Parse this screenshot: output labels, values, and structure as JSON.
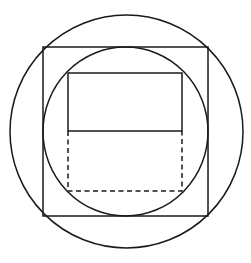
{
  "canvas": {
    "width": 251,
    "height": 263,
    "background": "#ffffff"
  },
  "stroke": {
    "color": "#1a1a1a",
    "width": 1.5,
    "dash": "5 3.5"
  },
  "figure": {
    "outer_circle": {
      "cx": 126.5,
      "cy": 131.5,
      "r": 116.5
    },
    "square": {
      "x": 43,
      "y": 47,
      "width": 165,
      "height": 169
    },
    "inner_circle": {
      "cx": 125.5,
      "cy": 131.5,
      "rx": 82.5,
      "ry": 84.5
    },
    "inner_rect_solid": {
      "x": 68,
      "y": 73,
      "width": 114,
      "height": 58
    },
    "inner_rect_dashed": {
      "x": 68,
      "y": 131,
      "width": 114,
      "height": 60
    }
  }
}
